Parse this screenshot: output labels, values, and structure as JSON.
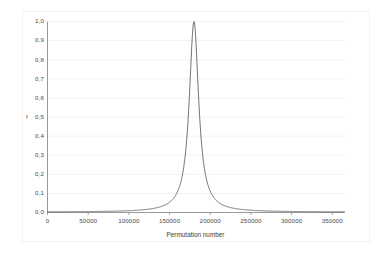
{
  "chart_data": {
    "type": "line",
    "title": "",
    "xlabel": "Permutation number",
    "ylabel": "f",
    "xlim": [
      0,
      365000
    ],
    "ylim": [
      0,
      1.0
    ],
    "grid": true,
    "legend": false,
    "xticks": [
      0,
      50000,
      100000,
      150000,
      200000,
      250000,
      300000,
      350000
    ],
    "xtick_labels": [
      "0",
      "50000",
      "100000",
      "150000",
      "200000",
      "250000",
      "300000",
      "350000"
    ],
    "yticks": [
      0.0,
      0.1,
      0.2,
      0.3,
      0.4,
      0.5,
      0.6,
      0.7,
      0.8,
      0.9,
      1.0
    ],
    "ytick_labels": [
      "0,0",
      "0,1",
      "0,2",
      "0,3",
      "0,4",
      "0,5",
      "0,6",
      "0,7",
      "0,8",
      "0,9",
      "1,0"
    ],
    "series": [
      {
        "name": "f",
        "color": "#595959",
        "peak_x": 180000,
        "peak_y": 1.0,
        "half_width_half_max": 7000,
        "x": [
          0,
          10000,
          20000,
          30000,
          40000,
          50000,
          60000,
          70000,
          80000,
          90000,
          100000,
          110000,
          120000,
          125000,
          130000,
          135000,
          140000,
          145000,
          150000,
          155000,
          158000,
          161000,
          164000,
          167000,
          170000,
          172000,
          174000,
          176000,
          178000,
          180000,
          182000,
          184000,
          186000,
          188000,
          190000,
          193000,
          196000,
          199000,
          202000,
          205000,
          210000,
          215000,
          220000,
          225000,
          230000,
          235000,
          240000,
          250000,
          260000,
          270000,
          280000,
          290000,
          300000,
          310000,
          320000,
          330000,
          340000,
          350000,
          360000
        ],
        "y": [
          0.002,
          0.002,
          0.002,
          0.002,
          0.003,
          0.003,
          0.003,
          0.004,
          0.005,
          0.006,
          0.008,
          0.011,
          0.016,
          0.02,
          0.026,
          0.035,
          0.049,
          0.072,
          0.113,
          0.188,
          0.258,
          0.362,
          0.506,
          0.68,
          0.843,
          0.924,
          0.968,
          0.992,
          1.0,
          1.0,
          1.0,
          0.992,
          0.968,
          0.924,
          0.843,
          0.68,
          0.506,
          0.362,
          0.258,
          0.188,
          0.113,
          0.072,
          0.049,
          0.035,
          0.026,
          0.02,
          0.016,
          0.011,
          0.008,
          0.006,
          0.005,
          0.004,
          0.003,
          0.003,
          0.003,
          0.002,
          0.002,
          0.002,
          0.002
        ]
      }
    ]
  },
  "style": {
    "background": "#ffffff",
    "gridline_color": "#ececec",
    "axis_color": "#7f7f7f",
    "curve_color": "#595959",
    "text_color": "#4a4a4a"
  }
}
